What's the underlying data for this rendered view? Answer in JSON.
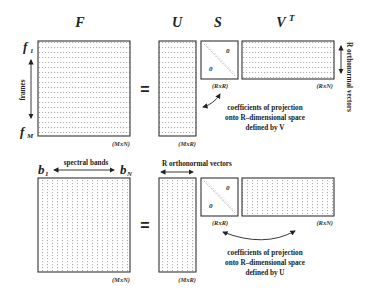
{
  "top": {
    "matrices": {
      "F": {
        "label": "F",
        "dim": "(MxN)"
      },
      "U": {
        "label": "U",
        "dim": "(MxR)"
      },
      "S": {
        "label": "S",
        "dim": "(RxR)",
        "zero_upper": "0",
        "zero_lower": "0"
      },
      "VT": {
        "label": "V",
        "sup": "T",
        "dim": "(RxN)"
      }
    },
    "row_first": {
      "base": "f",
      "sub": "1"
    },
    "row_last": {
      "base": "f",
      "sub": "M"
    },
    "axis_label": "frames",
    "equals": "=",
    "side_label": "R orthonormal vectors",
    "annotation": [
      "coefficients of projection",
      "onto R–dimensional space",
      "defined by V"
    ]
  },
  "bottom": {
    "matrices": {
      "F": {
        "dim": "(MxN)"
      },
      "U": {
        "dim": "(MxR)"
      },
      "S": {
        "dim": "(RxR)",
        "zero_upper": "0",
        "zero_lower": "0"
      },
      "VT": {
        "dim": "(RxN)"
      }
    },
    "col_first": {
      "base": "b",
      "sub": "1"
    },
    "col_last": {
      "base": "b",
      "sub": "N"
    },
    "axis_label": "spectral bands",
    "equals": "=",
    "top_label": "R orthonormal vectors",
    "annotation": [
      "coefficients of projection",
      "onto R–dimensional space",
      "defined by U"
    ]
  },
  "colors": {
    "ink": "#222222",
    "grid": "#9a9a9a",
    "background": "#ffffff"
  }
}
